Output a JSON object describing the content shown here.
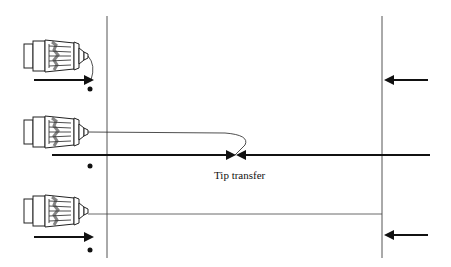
{
  "diagram": {
    "type": "schematic",
    "labels": {
      "tip_transfer": "Tip transfer"
    },
    "panels": [
      {
        "id": "top",
        "objective": "objective-lens",
        "arrow_left": "right",
        "arrow_right": "left",
        "fiber": "short-loop"
      },
      {
        "id": "middle",
        "objective": "objective-lens",
        "arrows": "converging",
        "fiber": "loop-to-center",
        "annotation": "Tip transfer"
      },
      {
        "id": "bottom",
        "objective": "objective-lens",
        "arrow_left": "right",
        "arrow_right": "left",
        "fiber": "straight-to-right-wall"
      }
    ],
    "colors": {
      "line": "#111111",
      "wall": "#555555",
      "background": "#ffffff"
    }
  }
}
